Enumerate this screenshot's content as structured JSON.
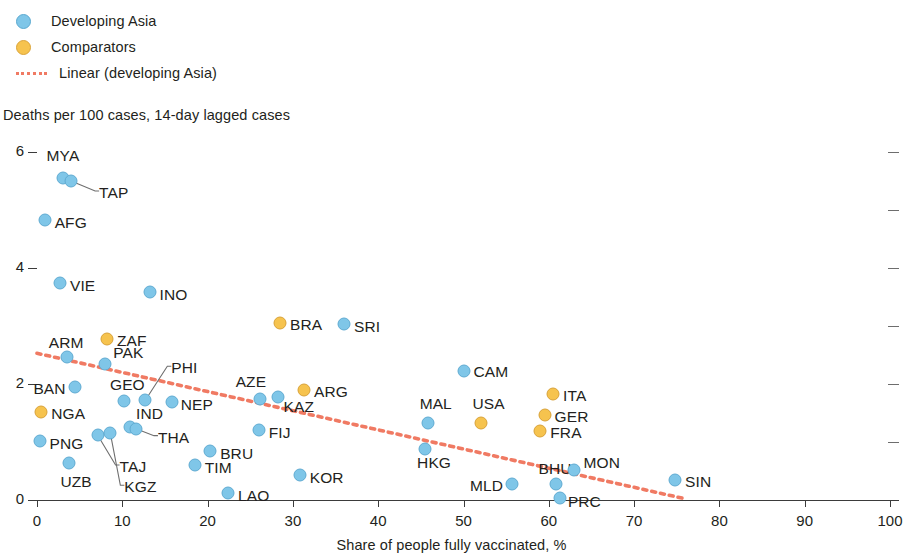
{
  "legend": {
    "items": [
      {
        "label": "Developing Asia",
        "marker": "circle-blue",
        "color": "#7fc6e8"
      },
      {
        "label": "Comparators",
        "marker": "circle-orange",
        "color": "#f6c34e"
      },
      {
        "label": "Linear (developing Asia)",
        "marker": "dotted-line",
        "color": "#f07a63"
      }
    ]
  },
  "chart_data": {
    "type": "scatter",
    "title": "",
    "ylabel": "Deaths per 100 cases, 14-day lagged cases",
    "xlabel": "Share of people fully vaccinated, %",
    "xlim": [
      0,
      100
    ],
    "ylim": [
      0,
      6
    ],
    "xticks": [
      0,
      10,
      20,
      30,
      40,
      50,
      60,
      70,
      80,
      90,
      100
    ],
    "yticks": [
      0,
      2,
      4,
      6
    ],
    "yticks_right": [
      0,
      1,
      2,
      3,
      4,
      5,
      6
    ],
    "grid": false,
    "legend_position": "top-left",
    "series": [
      {
        "name": "Developing Asia",
        "color": "#7fc6e8",
        "points": [
          {
            "label": "MYA",
            "x": 3.0,
            "y": 5.55,
            "label_dx": -16,
            "label_dy": -20
          },
          {
            "label": "TAP",
            "x": 4.0,
            "y": 5.5,
            "label_dx": 28,
            "label_dy": 14,
            "leader": true
          },
          {
            "label": "AFG",
            "x": 0.9,
            "y": 4.82,
            "label_dx": 10,
            "label_dy": 5
          },
          {
            "label": "VIE",
            "x": 2.7,
            "y": 3.75,
            "label_dx": 10,
            "label_dy": 5
          },
          {
            "label": "INO",
            "x": 13.2,
            "y": 3.59,
            "label_dx": 10,
            "label_dy": 5
          },
          {
            "label": "SRI",
            "x": 36.0,
            "y": 3.04,
            "label_dx": 10,
            "label_dy": 5
          },
          {
            "label": "ARM",
            "x": 3.5,
            "y": 2.47,
            "label_dx": -18,
            "label_dy": -12
          },
          {
            "label": "PAK",
            "x": 8.0,
            "y": 2.35,
            "label_dx": 8,
            "label_dy": -9
          },
          {
            "label": "BAN",
            "x": 4.5,
            "y": 1.95,
            "label_dx": -42,
            "label_dy": 4
          },
          {
            "label": "GEO",
            "x": 10.2,
            "y": 1.71,
            "label_dx": -14,
            "label_dy": -14
          },
          {
            "label": "PHI",
            "x": 12.7,
            "y": 1.72,
            "label_dx": 26,
            "label_dy": -30,
            "leader": true
          },
          {
            "label": "NEP",
            "x": 15.8,
            "y": 1.69,
            "label_dx": 9,
            "label_dy": 5
          },
          {
            "label": "PNG",
            "x": 0.3,
            "y": 1.02,
            "label_dx": 10,
            "label_dy": 5
          },
          {
            "label": "IND",
            "x": 10.9,
            "y": 1.26,
            "label_dx": 6,
            "label_dy": -11
          },
          {
            "label": "THA",
            "x": 11.6,
            "y": 1.23,
            "label_dx": 22,
            "label_dy": 11,
            "leader": true
          },
          {
            "label": "TAJ",
            "x": 7.1,
            "y": 1.12,
            "label_dx": 22,
            "label_dy": 34,
            "leader": true
          },
          {
            "label": "KGZ",
            "x": 8.6,
            "y": 1.15,
            "label_dx": 14,
            "label_dy": 56,
            "leader": true
          },
          {
            "label": "UZB",
            "x": 3.8,
            "y": 0.64,
            "label_dx": -9,
            "label_dy": 21
          },
          {
            "label": "TIM",
            "x": 18.5,
            "y": 0.6,
            "label_dx": 10,
            "label_dy": 5
          },
          {
            "label": "BRU",
            "x": 20.3,
            "y": 0.85,
            "label_dx": 10,
            "label_dy": 5
          },
          {
            "label": "FIJ",
            "x": 26.0,
            "y": 1.2,
            "label_dx": 10,
            "label_dy": 5
          },
          {
            "label": "AZE",
            "x": 26.1,
            "y": 1.74,
            "label_dx": -24,
            "label_dy": -15
          },
          {
            "label": "KAZ",
            "x": 28.2,
            "y": 1.77,
            "label_dx": 6,
            "label_dy": 12
          },
          {
            "label": "LAO",
            "x": 22.4,
            "y": 0.12,
            "label_dx": 10,
            "label_dy": 5
          },
          {
            "label": "KOR",
            "x": 30.8,
            "y": 0.43,
            "label_dx": 10,
            "label_dy": 5
          },
          {
            "label": "CAM",
            "x": 50.0,
            "y": 2.22,
            "label_dx": 10,
            "label_dy": 3
          },
          {
            "label": "MAL",
            "x": 45.8,
            "y": 1.32,
            "label_dx": -8,
            "label_dy": -17
          },
          {
            "label": "HKG",
            "x": 45.5,
            "y": 0.88,
            "label_dx": -8,
            "label_dy": 16
          },
          {
            "label": "MLD",
            "x": 55.7,
            "y": 0.28,
            "label_dx": -42,
            "label_dy": 4
          },
          {
            "label": "BHU",
            "x": 60.9,
            "y": 0.27,
            "label_dx": -18,
            "label_dy": -13
          },
          {
            "label": "PRC",
            "x": 61.3,
            "y": 0.04,
            "label_dx": 8,
            "label_dy": 6
          },
          {
            "label": "MON",
            "x": 62.9,
            "y": 0.52,
            "label_dx": 10,
            "label_dy": -5
          },
          {
            "label": "SIN",
            "x": 74.8,
            "y": 0.34,
            "label_dx": 10,
            "label_dy": 4
          }
        ]
      },
      {
        "name": "Comparators",
        "color": "#f6c34e",
        "points": [
          {
            "label": "ZAF",
            "x": 8.2,
            "y": 2.77,
            "label_dx": 10,
            "label_dy": 4
          },
          {
            "label": "NGA",
            "x": 0.5,
            "y": 1.52,
            "label_dx": 10,
            "label_dy": 4
          },
          {
            "label": "BRA",
            "x": 28.5,
            "y": 3.06,
            "label_dx": 10,
            "label_dy": 4
          },
          {
            "label": "ARG",
            "x": 31.3,
            "y": 1.9,
            "label_dx": 10,
            "label_dy": 4
          },
          {
            "label": "USA",
            "x": 52.0,
            "y": 1.32,
            "label_dx": -8,
            "label_dy": -17
          },
          {
            "label": "ITA",
            "x": 60.5,
            "y": 1.83,
            "label_dx": 10,
            "label_dy": 4
          },
          {
            "label": "GER",
            "x": 59.5,
            "y": 1.47,
            "label_dx": 10,
            "label_dy": 4
          },
          {
            "label": "FRA",
            "x": 59.0,
            "y": 1.19,
            "label_dx": 10,
            "label_dy": 4
          }
        ]
      }
    ],
    "trendline": {
      "name": "Linear (developing Asia)",
      "color": "#f07a63",
      "style": "dotted",
      "x0": 0.0,
      "y0": 2.53,
      "x1": 76.0,
      "y1": 0.02
    }
  }
}
